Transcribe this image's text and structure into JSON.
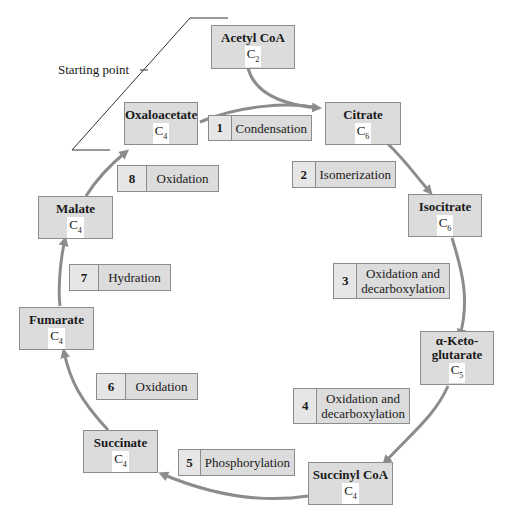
{
  "starting_point_label": "Starting point",
  "arrow_color": "#8c8c8c",
  "box_fill": "#dcdcdc",
  "molecules": [
    {
      "name": "Acetyl CoA",
      "carbon": "C",
      "sub": "2"
    },
    {
      "name": "Citrate",
      "carbon": "C",
      "sub": "6"
    },
    {
      "name": "Isocitrate",
      "carbon": "C",
      "sub": "6"
    },
    {
      "name": "α-Keto-glutarate",
      "carbon": "C",
      "sub": "5"
    },
    {
      "name": "Succinyl CoA",
      "carbon": "C",
      "sub": "4"
    },
    {
      "name": "Succinate",
      "carbon": "C",
      "sub": "4"
    },
    {
      "name": "Fumarate",
      "carbon": "C",
      "sub": "4"
    },
    {
      "name": "Malate",
      "carbon": "C",
      "sub": "4"
    },
    {
      "name": "Oxaloacetate",
      "carbon": "C",
      "sub": "4"
    }
  ],
  "steps": [
    {
      "num": "1",
      "label": "Condensation"
    },
    {
      "num": "2",
      "label": "Isomerization"
    },
    {
      "num": "3",
      "label": "Oxidation and decarboxylation"
    },
    {
      "num": "4",
      "label": "Oxidation and decarboxylation"
    },
    {
      "num": "5",
      "label": "Phosphorylation"
    },
    {
      "num": "6",
      "label": "Oxidation"
    },
    {
      "num": "7",
      "label": "Hydration"
    },
    {
      "num": "8",
      "label": "Oxidation"
    }
  ]
}
